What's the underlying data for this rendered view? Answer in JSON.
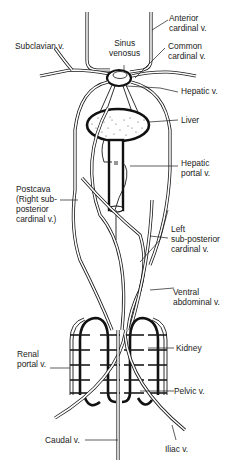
{
  "diagram": {
    "labels": {
      "anterior_cardinal": "Anterior\ncardinal v.",
      "subclavian": "Subclavian v.",
      "sinus_venosus": "Sinus\nvenosus",
      "common_cardinal": "Common\ncardinal v.",
      "hepatic": "Hepatic v.",
      "liver": "Liver",
      "hepatic_portal": "Hepatic\nportal v.",
      "postcava": "Postcava\n(Right sub-\nposterior\ncardinal v.)",
      "left_subposterior_cardinal": "Left\nsub-posterior\ncardinal v.",
      "ventral_abdominal": "Ventral\nabdominal v.",
      "kidney": "Kidney",
      "renal_portal": "Renal\nportal v.",
      "pelvic": "Pelvic v.",
      "caudal": "Caudal v.",
      "iliac": "Iliac v."
    },
    "colors": {
      "line": "#1a1a1a",
      "background": "#ffffff",
      "liver_fill": "#ffffff"
    }
  }
}
